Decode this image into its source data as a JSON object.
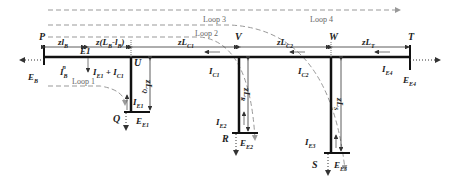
{
  "nodes": {
    "P": "P",
    "U": "U",
    "V": "V",
    "W": "W",
    "T": "T",
    "Q": "Q",
    "R": "R",
    "S": "S"
  },
  "loops": [
    "Loop 1",
    "Loop 2",
    "Loop 3",
    "Loop 4"
  ],
  "currents": {
    "IB": {
      "base": "I",
      "sub": "B",
      "sup": "n"
    },
    "IE1C1": {
      "text1": "I",
      "sub1": "E1",
      "text2": " + I",
      "sub2": "C1",
      "sup": "n"
    },
    "IC1": {
      "base": "I",
      "sub": "C1",
      "sup": "n"
    },
    "IC2": {
      "base": "I",
      "sub": "C2",
      "sup": "n"
    },
    "IE4": {
      "base": "I",
      "sub": "E4",
      "sup": "n"
    },
    "IE1": {
      "base": "I",
      "sub": "E1",
      "sup": "n"
    },
    "IE2": {
      "base": "I",
      "sub": "E2",
      "sup": "n"
    },
    "IE3": {
      "base": "I",
      "sub": "E3",
      "sup": "n"
    }
  },
  "voltages": {
    "EB": {
      "base": "E",
      "sub": "B",
      "sup": "n"
    },
    "EE1": {
      "base": "E",
      "sub": "E1",
      "sup": "n"
    },
    "EE2": {
      "base": "E",
      "sub": "E2",
      "sup": "n"
    },
    "EE3": {
      "base": "E",
      "sub": "E3",
      "sup": "n"
    },
    "EE4": {
      "base": "E",
      "sub": "E4",
      "sup": "n"
    }
  },
  "dimensions": {
    "zlB": {
      "base": "zl",
      "sub": "B"
    },
    "E1": "E1",
    "zLBlB": "z(L",
    "zLBlB_sub1": "B",
    "zLBlB_mid": "-l",
    "zLBlB_sub2": "B",
    "zLBlB_end": ")",
    "zLC1": {
      "base": "zL",
      "sub": "C1"
    },
    "zLC2": {
      "base": "zL",
      "sub": "C2"
    },
    "zLT": {
      "base": "zL",
      "sub": "T"
    },
    "zLQ": {
      "base": "zL",
      "sub": "Q"
    },
    "zLR": {
      "base": "zL",
      "sub": "R"
    },
    "zLS": {
      "base": "zL",
      "sub": "S"
    }
  }
}
